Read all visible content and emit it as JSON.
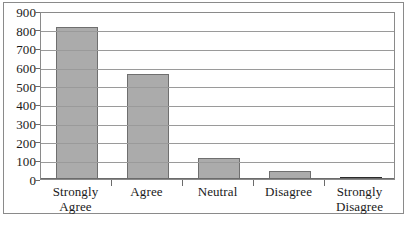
{
  "chart_data": {
    "type": "bar",
    "title": "",
    "subtitle": "",
    "xlabel": "",
    "ylabel": "",
    "categories": [
      "Strongly Agree",
      "Agree",
      "Neutral",
      "Disagree",
      "Strongly Disagree"
    ],
    "category_lines": [
      [
        "Strongly",
        "Agree"
      ],
      [
        "Agree"
      ],
      [
        "Neutral"
      ],
      [
        "Disagree"
      ],
      [
        "Strongly",
        "Disagree"
      ]
    ],
    "values": [
      815,
      560,
      115,
      45,
      10
    ],
    "ylim": [
      0,
      900
    ],
    "ytick_labels": [
      "900",
      "800",
      "700",
      "600",
      "500",
      "400",
      "300",
      "200",
      "100",
      "0"
    ],
    "ytick_values": [
      900,
      800,
      700,
      600,
      500,
      400,
      300,
      200,
      100,
      0
    ],
    "ytick_step": 100,
    "grid": true,
    "legend": false,
    "bar_color": "#ababab",
    "bar_edge_color": "#6f6f6f",
    "grid_color": "#9a9a9a",
    "axis_color": "#6b6b6b",
    "background_color": "#ffffff"
  }
}
